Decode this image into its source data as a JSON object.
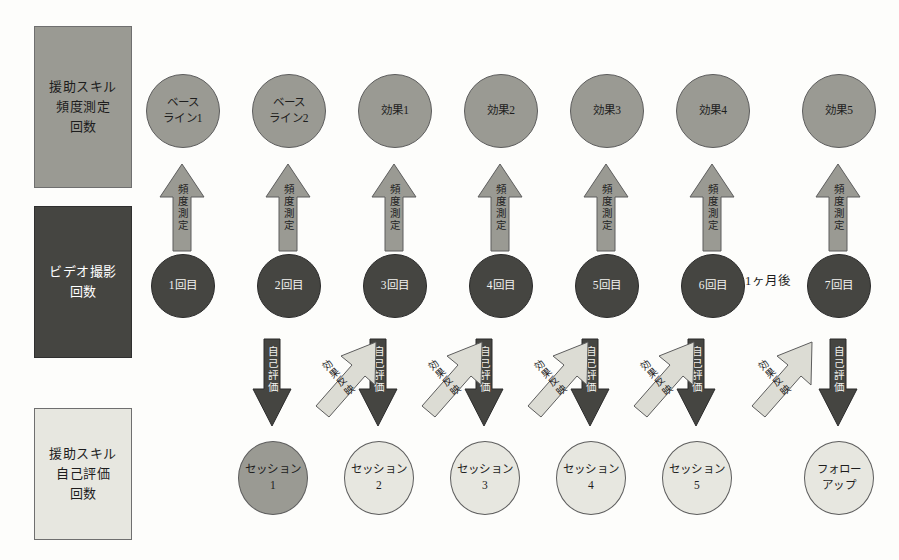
{
  "diagram": {
    "background_color": "#fdfdfb",
    "palette": {
      "mid_gray": "#9a9a93",
      "dark_gray": "#454541",
      "light_gray": "#dcdcd4",
      "pale_gray": "#e7e7e0",
      "outline": "#5d5d5d",
      "text_dark": "#1d1d1d",
      "text_light": "#f3f3f0"
    },
    "categories": [
      {
        "id": "skill-frequency",
        "lines": [
          "援助スキル",
          "頻度測定",
          "回数"
        ],
        "fill": "#9a9a93",
        "text_color": "#1d1d1d"
      },
      {
        "id": "video-recording",
        "lines": [
          "ビデオ撮影",
          "回数"
        ],
        "fill": "#454541",
        "text_color": "#ffffff"
      },
      {
        "id": "skill-self-eval",
        "lines": [
          "援助スキル",
          "自己評価",
          "回数"
        ],
        "fill": "#e7e7e0",
        "text_color": "#1d1d1d"
      }
    ],
    "measure_row": {
      "label": "測定結果行",
      "nodes": [
        {
          "lines": [
            "ベース",
            "ライン1"
          ],
          "fill": "#9a9a93"
        },
        {
          "lines": [
            "ベース",
            "ライン2"
          ],
          "fill": "#9a9a93"
        },
        {
          "lines": [
            "効果1"
          ],
          "fill": "#9a9a93"
        },
        {
          "lines": [
            "効果2"
          ],
          "fill": "#9a9a93"
        },
        {
          "lines": [
            "効果3"
          ],
          "fill": "#9a9a93"
        },
        {
          "lines": [
            "効果4"
          ],
          "fill": "#9a9a93"
        },
        {
          "lines": [
            "効果5"
          ],
          "fill": "#9a9a93"
        }
      ]
    },
    "up_arrows": {
      "label": "頻度測定",
      "count": 7,
      "fill": "#9a9a93"
    },
    "video_row": {
      "label": "ビデオ撮影行",
      "nodes": [
        {
          "lines": [
            "1回目"
          ],
          "fill": "#454541"
        },
        {
          "lines": [
            "2回目"
          ],
          "fill": "#454541"
        },
        {
          "lines": [
            "3回目"
          ],
          "fill": "#454541"
        },
        {
          "lines": [
            "4回目"
          ],
          "fill": "#454541"
        },
        {
          "lines": [
            "5回目"
          ],
          "fill": "#454541"
        },
        {
          "lines": [
            "6回目"
          ],
          "fill": "#454541"
        },
        {
          "lines": [
            "7回目"
          ],
          "fill": "#454541"
        }
      ],
      "note": "1ヶ月後"
    },
    "down_arrows": {
      "label": "自己評価",
      "count": 6,
      "fill": "#454541"
    },
    "diagonal_arrows": {
      "label": "効果反映",
      "count": 5,
      "fill": "#dcdcd4"
    },
    "session_row": {
      "label": "セッション行",
      "nodes": [
        {
          "lines": [
            "セッション",
            "1"
          ],
          "fill": "#9a9a93"
        },
        {
          "lines": [
            "セッション",
            "2"
          ],
          "fill": "#e7e7e0"
        },
        {
          "lines": [
            "セッション",
            "3"
          ],
          "fill": "#e7e7e0"
        },
        {
          "lines": [
            "セッション",
            "4"
          ],
          "fill": "#e7e7e0"
        },
        {
          "lines": [
            "セッション",
            "5"
          ],
          "fill": "#e7e7e0"
        },
        {
          "lines": [
            "フォロー",
            "アップ"
          ],
          "fill": "#e7e7e0"
        }
      ]
    }
  }
}
